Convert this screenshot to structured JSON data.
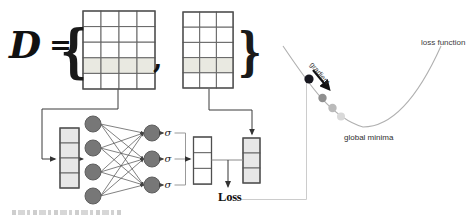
{
  "figure": {
    "dataset": {
      "symbol": "D",
      "equals": "=",
      "brace_left": "{",
      "brace_right": "}",
      "separator": ",",
      "matrix_left": {
        "rows": 5,
        "cols": 4,
        "highlighted_row": 4
      },
      "matrix_right": {
        "rows": 5,
        "cols": 3,
        "highlighted_row": 4
      }
    },
    "network": {
      "input_vector_cells": 4,
      "input_nodes": 4,
      "output_nodes": 3,
      "activation_symbol": "σ",
      "prediction_vector_cells": 3,
      "target_vector_cells": 3
    },
    "loss": {
      "label": "Loss",
      "curve_label": "loss function",
      "minima_label": "global minima",
      "gradient_label": "gradient"
    },
    "colors": {
      "highlight_fill": "#e9e9e1",
      "vector_fill": "#e7e7e7",
      "node_fill": "#777777",
      "node_stroke": "#5e5e5e",
      "grid_stroke": "#666666",
      "curve_stroke": "#b0b0b0",
      "connector_light": "#cccccc",
      "line_dark": "#3a3a3a",
      "descent_dots": [
        "#17171f",
        "#8f8f8f",
        "#bababa",
        "#d9d9d9"
      ]
    }
  }
}
